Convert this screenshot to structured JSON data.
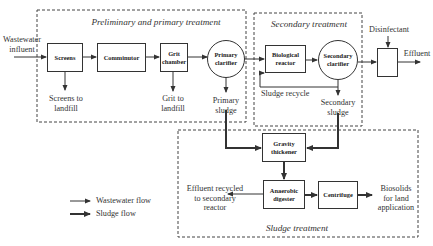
{
  "sections": {
    "primary": "Preliminary and primary treatment",
    "secondary": "Secondary treatment",
    "sludge": "Sludge treatment"
  },
  "nodes": {
    "screens": "Screens",
    "comminutor": "Comminutor",
    "grit_chamber": "Grit\nchamber",
    "primary_clarifier": "Primary\nclarifier",
    "biological_reactor": "Biological\nreactor",
    "secondary_clarifier": "Secondary\nclarifier",
    "disinfection_unit": "",
    "gravity_thickener": "Gravity\nthickener",
    "anaerobic_digester": "Anaerobic\ndigester",
    "centrifuge": "Centrifuge"
  },
  "labels": {
    "influent": "Wastewater\ninfluent",
    "screens_out": "Screens to\nlandfill",
    "grit_out": "Grit to\nlandfill",
    "primary_sludge": "Primary\nsludge",
    "sludge_recycle": "Sludge recycle",
    "secondary_sludge": "Secondary\nsludge",
    "disinfectant": "Disinfectant",
    "effluent": "Effluent",
    "effluent_recycled": "Effluent recycled\nto secondary\nreactor",
    "biosolids": "Biosolids\nfor land\napplication"
  },
  "legend": {
    "wastewater_flow": "Wastewater flow",
    "sludge_flow": "Sludge flow"
  },
  "colors": {
    "line": "#333333",
    "background": "#ffffff"
  }
}
